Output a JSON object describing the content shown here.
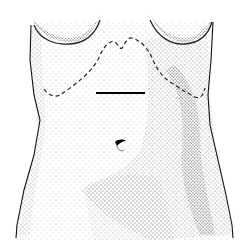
{
  "figure": {
    "colors": {
      "ink": "#111111",
      "background": "#ffffff"
    }
  }
}
